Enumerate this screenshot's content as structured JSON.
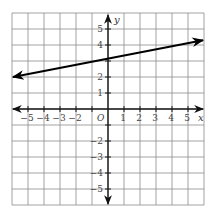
{
  "chart_data": {
    "type": "line",
    "title": "",
    "xlabel": "x",
    "ylabel": "y",
    "origin_label": "O",
    "xlim": [
      -6,
      6
    ],
    "ylim": [
      -6,
      6
    ],
    "grid": true,
    "x_ticks": [
      -5,
      -4,
      -3,
      -2,
      1,
      2,
      3,
      4,
      5
    ],
    "x_tick_labels": [
      "−5",
      "−4",
      "−3",
      "−2",
      "1",
      "2",
      "3",
      "4",
      "5"
    ],
    "y_ticks": [
      5,
      4,
      2,
      1,
      -2,
      -3,
      -4,
      -5
    ],
    "y_tick_labels": [
      "5",
      "4",
      "2",
      "1",
      "−2",
      "−3",
      "−4",
      "−5"
    ],
    "series": [
      {
        "name": "line",
        "x": [
          -6,
          6
        ],
        "y": [
          2,
          4.3
        ],
        "arrows": "both",
        "color": "#000000"
      }
    ],
    "approx_equation": "y ≈ 0.19x + 3.1",
    "colors": {
      "grid": "#8a8a8a",
      "axis": "#1a1a1a",
      "line": "#000000"
    }
  }
}
